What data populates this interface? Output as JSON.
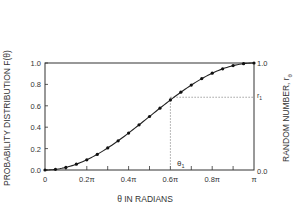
{
  "chart_data": {
    "type": "line",
    "title": "",
    "xlabel": "θ IN RADIANS",
    "ylabel": "PROBABILITY DISTRIBUTION F(θ)",
    "ylabel_right": "RANDOM NUMBER, r_θ",
    "xlim": [
      0,
      3.14159
    ],
    "ylim": [
      0,
      1.0
    ],
    "x_ticks": [
      "0",
      "0.2π",
      "0.4π",
      "0.6π",
      "0.8π",
      "π"
    ],
    "y_ticks": [
      "0.0",
      "0.2",
      "0.4",
      "0.6",
      "0.8",
      "1.0"
    ],
    "y_ticks_right": [
      "0.0",
      "1.0"
    ],
    "grid": false,
    "series": [
      {
        "name": "F(θ)",
        "x_pi": [
          0,
          0.05,
          0.1,
          0.15,
          0.2,
          0.25,
          0.3,
          0.35,
          0.4,
          0.45,
          0.5,
          0.55,
          0.6,
          0.65,
          0.7,
          0.75,
          0.8,
          0.85,
          0.9,
          0.95,
          1.0
        ],
        "values": [
          0.0,
          0.006,
          0.024,
          0.054,
          0.095,
          0.146,
          0.206,
          0.273,
          0.345,
          0.422,
          0.5,
          0.578,
          0.655,
          0.727,
          0.794,
          0.854,
          0.905,
          0.946,
          0.976,
          0.994,
          1.0
        ]
      }
    ],
    "annotations": [
      {
        "label": "θ₁",
        "x_pi": 0.6,
        "type": "vertical-dotted"
      },
      {
        "label": "r₁",
        "y": 0.68,
        "type": "horizontal-dotted"
      }
    ]
  },
  "labels": {
    "ylabel": "PROBABILITY DISTRIBUTION  F(θ)",
    "ylabel_right": "RANDOM NUMBER, r",
    "ylabel_right_sub": "θ",
    "xlabel": "θ  IN RADIANS",
    "theta1": "θ",
    "theta1_sub": "1",
    "r1": "r",
    "r1_sub": "1"
  }
}
